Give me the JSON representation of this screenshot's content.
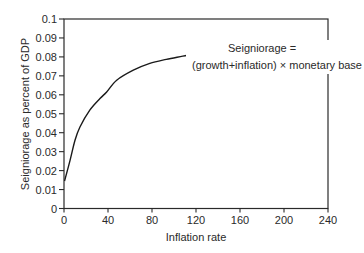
{
  "chart_data": {
    "type": "line",
    "title": "",
    "xlabel": "Inflation rate",
    "ylabel": "Seigniorage as percent of GDP",
    "xlim": [
      0,
      240
    ],
    "ylim": [
      0,
      0.1
    ],
    "x_ticks": [
      0,
      40,
      80,
      120,
      160,
      200,
      240
    ],
    "y_ticks": [
      0,
      0.01,
      0.02,
      0.03,
      0.04,
      0.05,
      0.06,
      0.07,
      0.08,
      0.09,
      0.1
    ],
    "y_tick_labels": [
      "0",
      "0.01",
      "0.02",
      "0.03",
      "0.04",
      "0.05",
      "0.06",
      "0.07",
      "0.08",
      "0.09",
      "0.1"
    ],
    "x_tick_labels": [
      "0",
      "40",
      "80",
      "120",
      "160",
      "200",
      "240"
    ],
    "grid": false,
    "legend": null,
    "series": [
      {
        "name": "Seigniorage",
        "color": "#1a1a1a",
        "x": [
          0.5,
          5.5,
          10,
          14.5,
          23.6,
          32.7,
          38.8,
          47.9,
          63,
          78,
          93,
          108,
          124,
          142,
          145
        ],
        "y": [
          0.0145,
          0.0254,
          0.036,
          0.043,
          0.052,
          0.058,
          0.0615,
          0.0677,
          0.073,
          0.0766,
          0.0787,
          0.0804,
          0.0822,
          0.084,
          0.0845
        ]
      }
    ],
    "annotations": [
      {
        "line1": "Seigniorage =",
        "line2": "(growth+inflation) × monetary base",
        "points_to_x": 145,
        "points_to_y": 0.0845
      }
    ]
  },
  "colors": {
    "axis": "#2a2a2a",
    "line": "#1a1a1a",
    "background": "#ffffff"
  }
}
